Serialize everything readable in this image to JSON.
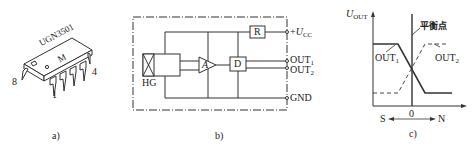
{
  "panels": {
    "a": {
      "caption": "a)",
      "chip": {
        "marking_line1": "UGN3501",
        "marking_line2": "M",
        "pin_labels": {
          "pin8": "8",
          "pin1": "1",
          "pin4": "4"
        }
      }
    },
    "b": {
      "caption": "b)",
      "blocks": {
        "hall": "HG",
        "amplifier": "A",
        "driver": "D",
        "resistor": "R"
      },
      "pins": {
        "vcc_prefix": "+",
        "vcc_main": "U",
        "vcc_sub": "CC",
        "out1_main": "OUT",
        "out1_sub": "1",
        "out2_main": "OUT",
        "out2_sub": "2",
        "gnd": "GND"
      }
    },
    "c": {
      "caption": "c)",
      "y_axis_main": "U",
      "y_axis_sub": "OUT",
      "balance_point": "平衡点",
      "out1_main": "OUT",
      "out1_sub": "1",
      "out2_main": "OUT",
      "out2_sub": "2",
      "origin": "0",
      "south": "S",
      "north": "N"
    }
  },
  "colors": {
    "line": "#222222",
    "background": "#ffffff"
  }
}
